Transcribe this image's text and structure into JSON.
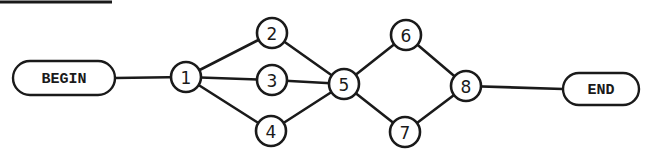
{
  "diagram": {
    "type": "network-flow-graph",
    "terminals": {
      "begin": {
        "label": "BEGIN",
        "x": 64,
        "y": 78,
        "w": 102,
        "h": 34
      },
      "end": {
        "label": "END",
        "x": 601,
        "y": 89,
        "w": 76,
        "h": 32
      }
    },
    "nodes": [
      {
        "id": "1",
        "label": "1",
        "x": 186,
        "y": 77
      },
      {
        "id": "2",
        "label": "2",
        "x": 272,
        "y": 33
      },
      {
        "id": "3",
        "label": "3",
        "x": 272,
        "y": 80
      },
      {
        "id": "4",
        "label": "4",
        "x": 271,
        "y": 131
      },
      {
        "id": "5",
        "label": "5",
        "x": 344,
        "y": 84
      },
      {
        "id": "6",
        "label": "6",
        "x": 406,
        "y": 35
      },
      {
        "id": "7",
        "label": "7",
        "x": 405,
        "y": 132
      },
      {
        "id": "8",
        "label": "8",
        "x": 466,
        "y": 86
      }
    ],
    "edges": [
      {
        "from": "BEGIN",
        "to": "1"
      },
      {
        "from": "1",
        "to": "2"
      },
      {
        "from": "1",
        "to": "3"
      },
      {
        "from": "1",
        "to": "4"
      },
      {
        "from": "2",
        "to": "5"
      },
      {
        "from": "3",
        "to": "5"
      },
      {
        "from": "4",
        "to": "5"
      },
      {
        "from": "5",
        "to": "6"
      },
      {
        "from": "5",
        "to": "7"
      },
      {
        "from": "6",
        "to": "8"
      },
      {
        "from": "7",
        "to": "8"
      },
      {
        "from": "8",
        "to": "END"
      }
    ],
    "colors": {
      "stroke": "#1a1a1a",
      "background": "#ffffff"
    }
  }
}
